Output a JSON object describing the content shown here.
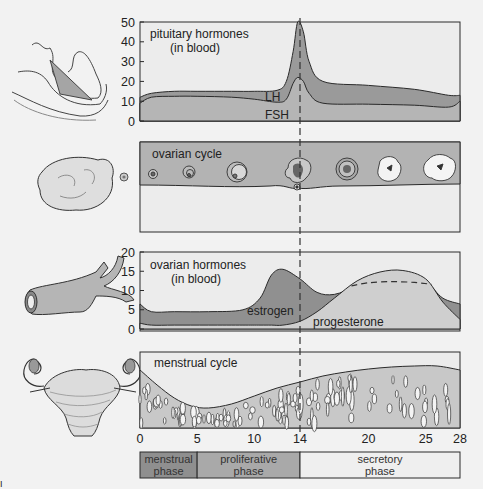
{
  "colors": {
    "background": "#f2f2f2",
    "dark_fill": "#8f8f8f",
    "mid_fill": "#a9a9a9",
    "light_fill": "#c6c6c6",
    "pale_fill": "#d9d9d9",
    "panel_fill": "#ececec",
    "line": "#2a2a2a"
  },
  "ovulation_day": 14,
  "x_axis": {
    "ticks": [
      "0",
      "5",
      "10",
      "14",
      "20",
      "25",
      "28"
    ],
    "tick_values": [
      0,
      5,
      10,
      14,
      20,
      25,
      28
    ],
    "range": [
      0,
      28
    ]
  },
  "panels": {
    "pituitary": {
      "title_line1": "pituitary hormones",
      "title_line2": "(in blood)",
      "y_ticks": [
        "50",
        "40",
        "30",
        "20",
        "10",
        "0"
      ],
      "labels": {
        "lh": "LH",
        "fsh": "FSH"
      },
      "icon": "pituitary-gland-icon"
    },
    "ovarian_cycle": {
      "title": "ovarian cycle",
      "icon": "ovary-icon",
      "stages": [
        "primordial follicle",
        "primary follicle",
        "secondary follicle",
        "ovulation",
        "corpus luteum",
        "corpus luteum",
        "corpus albicans"
      ]
    },
    "ovarian_hormones": {
      "title_line1": "ovarian hormones",
      "title_line2": "(in blood)",
      "y_ticks": [
        "20",
        "15",
        "10",
        "5",
        "0"
      ],
      "labels": {
        "estrogen": "estrogen",
        "progesterone": "progesterone"
      },
      "icon": "blood-vessel-icon"
    },
    "menstrual": {
      "title": "menstrual cycle",
      "icon": "uterus-icon"
    }
  },
  "phases": [
    {
      "line1": "menstrual",
      "line2": "phase",
      "start": 0,
      "end": 5
    },
    {
      "line1": "proliferative",
      "line2": "phase",
      "start": 5,
      "end": 14
    },
    {
      "line1": "secretory",
      "line2": "phase",
      "start": 14,
      "end": 28
    }
  ],
  "chart_data": [
    {
      "type": "area",
      "title": "pituitary hormones (in blood)",
      "ylim": [
        0,
        50
      ],
      "x": [
        0,
        1,
        3,
        5,
        8,
        10,
        12,
        12.8,
        13.4,
        13.8,
        14.3,
        14.8,
        16,
        20,
        24,
        27,
        28
      ],
      "series": [
        {
          "name": "LH",
          "values": [
            12,
            14,
            15,
            15,
            15,
            15,
            15.5,
            20,
            35,
            50,
            45,
            30,
            20,
            18,
            16,
            13,
            13
          ]
        },
        {
          "name": "FSH",
          "values": [
            9,
            12,
            12.5,
            12.5,
            12,
            11,
            9.5,
            11,
            19,
            22,
            20,
            14,
            9,
            8.5,
            8,
            7,
            10
          ]
        }
      ]
    },
    {
      "type": "area",
      "title": "ovarian hormones (in blood)",
      "ylim": [
        0,
        20
      ],
      "x": [
        0,
        1,
        3,
        6,
        9,
        10.5,
        11.5,
        12.5,
        14,
        15.5,
        17,
        19,
        21,
        23,
        25,
        26.5,
        28
      ],
      "series": [
        {
          "name": "estrogen",
          "values": [
            6.5,
            4.5,
            4.5,
            4.5,
            5,
            8,
            14,
            15.5,
            13,
            9.5,
            9,
            11,
            12,
            12,
            12,
            8,
            6.5
          ]
        },
        {
          "name": "progesterone",
          "values": [
            1.5,
            1,
            1,
            1,
            1,
            1,
            1,
            1,
            2,
            4.5,
            8,
            12.5,
            14.8,
            15.2,
            13,
            7,
            2.5
          ]
        }
      ]
    }
  ]
}
